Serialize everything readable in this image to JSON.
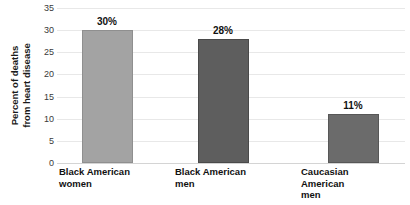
{
  "chart_data": {
    "type": "bar",
    "title": "",
    "subtitle": "",
    "xlabel": "",
    "ylabel_lines": [
      "Percent of deaths",
      "from heart disease"
    ],
    "ylabel": "Percent of deaths from heart disease",
    "ylim": [
      0,
      35
    ],
    "ytick_step": 5,
    "yticks": [
      35,
      30,
      25,
      20,
      15,
      10,
      5,
      0
    ],
    "ytick_labels": [
      "35",
      "30",
      "25",
      "20",
      "15",
      "10",
      "5",
      "0"
    ],
    "grid": true,
    "grid_axis": "y",
    "legend": false,
    "legend_position": "none",
    "categories": [
      "Black American women",
      "Black American men",
      "Caucasian American men"
    ],
    "category_label_lines": [
      [
        "Black American",
        "women"
      ],
      [
        "Black American",
        "men"
      ],
      [
        "Caucasian",
        "American",
        "men"
      ]
    ],
    "values": [
      30,
      28,
      11
    ],
    "data_labels": [
      "30%",
      "28%",
      "11%"
    ],
    "bar_colors": [
      "#a3a3a3",
      "#5e5e5e",
      "#6b6b6b"
    ],
    "bar_border_colors": [
      "#8f8f8f",
      "#4a4a4a",
      "#575757"
    ],
    "colors": {
      "background": "#ffffff",
      "gridline": "#e8e8e8",
      "baseline": "#d4d4d4",
      "axis_text": "#3a3a3a",
      "label_text": "#111111"
    }
  }
}
